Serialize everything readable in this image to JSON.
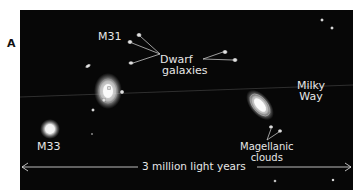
{
  "figure": {
    "panel_label": "A",
    "labels": {
      "m31": "M31",
      "m33": "M33",
      "dwarf_line1": "Dwarf",
      "dwarf_line2": "galaxies",
      "milky_line1": "Milky",
      "milky_line2": "Way",
      "magellanic_line1": "Magellanic",
      "magellanic_line2": "clouds"
    },
    "scale_bar": {
      "label": "3 million light years"
    },
    "colors": {
      "background": "#070707",
      "galaxy": "#f2f2f2",
      "text": "#e6e6e6"
    }
  }
}
